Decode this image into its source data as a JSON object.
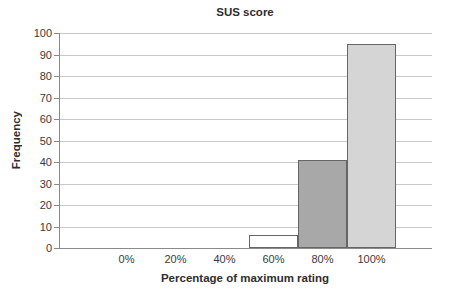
{
  "chart_data": {
    "type": "bar",
    "title": "SUS score",
    "xlabel": "Percentage of maximum rating",
    "ylabel": "Frequency",
    "categories": [
      "0%",
      "20%",
      "40%",
      "60%",
      "80%",
      "100%"
    ],
    "values": [
      0,
      0,
      0,
      6,
      41,
      95
    ],
    "yticks": [
      0,
      10,
      20,
      30,
      40,
      50,
      60,
      70,
      80,
      90,
      100
    ],
    "ylim": [
      0,
      100
    ],
    "grid": true,
    "legend": false,
    "colors": {
      "bar_fills": [
        null,
        null,
        null,
        "#ffffff",
        "#a8a8a8",
        "#d5d5d5"
      ],
      "bar_border": "#666666",
      "gridline": "#c8c8c8",
      "axis": "#8a8a8a",
      "text": "#3a3a3a"
    }
  }
}
